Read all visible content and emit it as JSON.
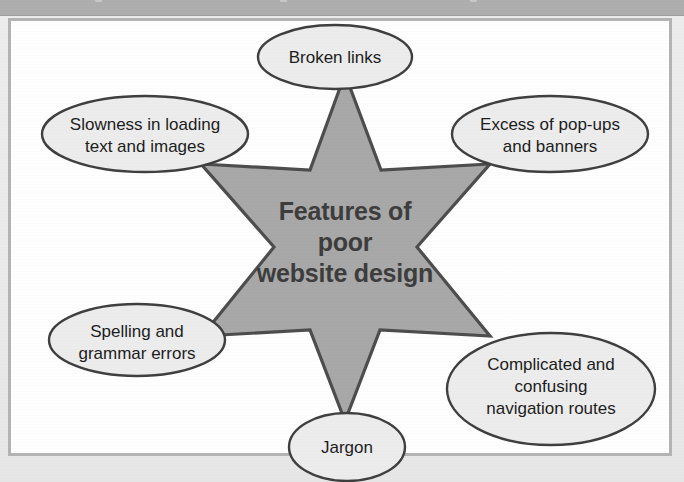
{
  "page": {
    "background_color": "#ebebeb",
    "frame_color": "#b4b4b4",
    "frame_fill": "#fefefe",
    "header_band_color": "#aeaeae"
  },
  "diagram": {
    "type": "star-mind-map",
    "shape": "six-pointed-star",
    "star_fill": "#a8a8a8",
    "star_stroke": "#4d4d4d",
    "node_fill": "#ececec",
    "node_stroke": "#3f3f3f",
    "center": {
      "line1": "Features of",
      "line2": "poor",
      "line3": "website design"
    },
    "nodes": [
      {
        "id": "broken-links",
        "position": "top",
        "lines": [
          "Broken links"
        ]
      },
      {
        "id": "slowness-loading",
        "position": "top-left",
        "lines": [
          "Slowness in loading",
          "text and images"
        ]
      },
      {
        "id": "excess-popups",
        "position": "top-right",
        "lines": [
          "Excess of pop-ups",
          "and banners"
        ]
      },
      {
        "id": "spelling-grammar",
        "position": "bottom-left",
        "lines": [
          "Spelling and",
          "grammar errors"
        ]
      },
      {
        "id": "complicated-navigation",
        "position": "bottom-right",
        "lines": [
          "Complicated and",
          "confusing",
          "navigation routes"
        ]
      },
      {
        "id": "jargon",
        "position": "bottom",
        "lines": [
          "Jargon"
        ]
      }
    ]
  }
}
